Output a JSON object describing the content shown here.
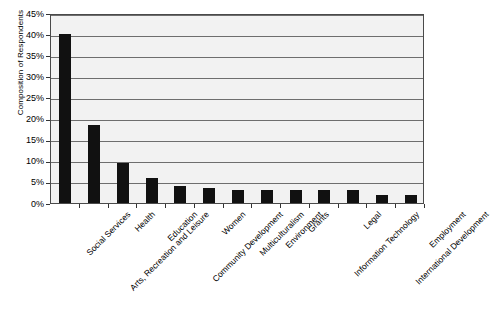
{
  "chart_data": {
    "type": "bar",
    "title": "",
    "xlabel": "",
    "ylabel": "Composition of Respondents",
    "ylim": [
      0,
      45
    ],
    "y_tick_labels": [
      "0%",
      "5%",
      "10%",
      "15%",
      "20%",
      "25%",
      "30%",
      "35%",
      "40%",
      "45%"
    ],
    "y_tick_values": [
      0,
      5,
      10,
      15,
      20,
      25,
      30,
      35,
      40,
      45
    ],
    "grid": true,
    "legend": "none",
    "bar_color": "#111111",
    "plot_background": "#f2f2f2",
    "categories": [
      "Social Services",
      "Arts, Recreation and Leisure",
      "Health",
      "Education",
      "Community Development",
      "Women",
      "Multiculturalism",
      "Environment",
      "Grants",
      "Information Technology",
      "Legal",
      "International Development",
      "Employment"
    ],
    "values": [
      40,
      18.5,
      9.5,
      6,
      4,
      3.5,
      3,
      3,
      3,
      3,
      3,
      2,
      2
    ]
  }
}
